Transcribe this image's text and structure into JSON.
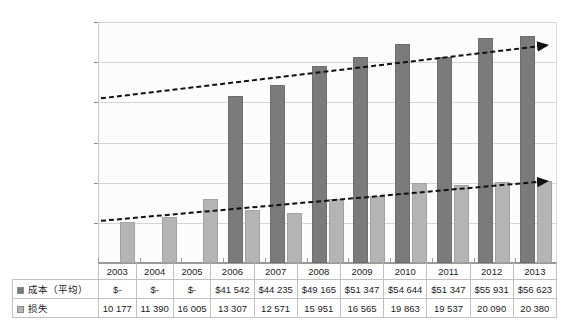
{
  "chart_data": {
    "type": "bar",
    "title": "",
    "xlabel": "",
    "ylabel": "",
    "ylim": [
      0,
      60000
    ],
    "ytick_labels": [
      "0",
      "10 000",
      "20 000",
      "30 000",
      "40 000",
      "50 000",
      "60 000"
    ],
    "ytick_values": [
      0,
      10000,
      20000,
      30000,
      40000,
      50000,
      60000
    ],
    "grid": true,
    "legend_position": "table-row-labels",
    "categories": [
      "2003",
      "2004",
      "2005",
      "2006",
      "2007",
      "2008",
      "2009",
      "2010",
      "2011",
      "2012",
      "2013"
    ],
    "series": [
      {
        "name": "成本（平均）",
        "color": "#7b7b7b",
        "marker": "cost-swatch",
        "values": [
          0,
          0,
          0,
          41542,
          44235,
          49165,
          51347,
          54644,
          51347,
          55931,
          56623
        ],
        "display_values": [
          "$-",
          "$-",
          "$-",
          "$41 542",
          "$44 235",
          "$49 165",
          "$51 347",
          "$54 644",
          "$51 347",
          "$55 931",
          "$56 623"
        ]
      },
      {
        "name": "损失",
        "color": "#b4b4b4",
        "marker": "loss-swatch",
        "values": [
          10177,
          11390,
          16005,
          13307,
          12571,
          15951,
          16565,
          19863,
          19537,
          20090,
          20380
        ],
        "display_values": [
          "10 177",
          "11 390",
          "16 005",
          "13 307",
          "12 571",
          "15 951",
          "16 565",
          "19 863",
          "19 537",
          "20 090",
          "20 380"
        ]
      }
    ],
    "trendlines": [
      {
        "name": "cost-trendline",
        "style": "dashed-with-arrow",
        "color": "#111111",
        "start_value": 41000,
        "end_value": 54200
      },
      {
        "name": "loss-trendline",
        "style": "dashed-with-arrow",
        "color": "#111111",
        "start_value": 10500,
        "end_value": 20400
      }
    ]
  },
  "table": {
    "year_header": [
      "2003",
      "2004",
      "2005",
      "2006",
      "2007",
      "2008",
      "2009",
      "2010",
      "2011",
      "2012",
      "2013"
    ],
    "rows": [
      {
        "label": "成本（平均）",
        "swatch": "cost-swatch",
        "cells": [
          "$-",
          "$-",
          "$-",
          "$41 542",
          "$44 235",
          "$49 165",
          "$51 347",
          "$54 644",
          "$51 347",
          "$55 931",
          "$56 623"
        ]
      },
      {
        "label": "损失",
        "swatch": "loss-swatch",
        "cells": [
          "10 177",
          "11 390",
          "16 005",
          "13 307",
          "12 571",
          "15 951",
          "16 565",
          "19 863",
          "19 537",
          "20 090",
          "20 380"
        ]
      }
    ]
  }
}
